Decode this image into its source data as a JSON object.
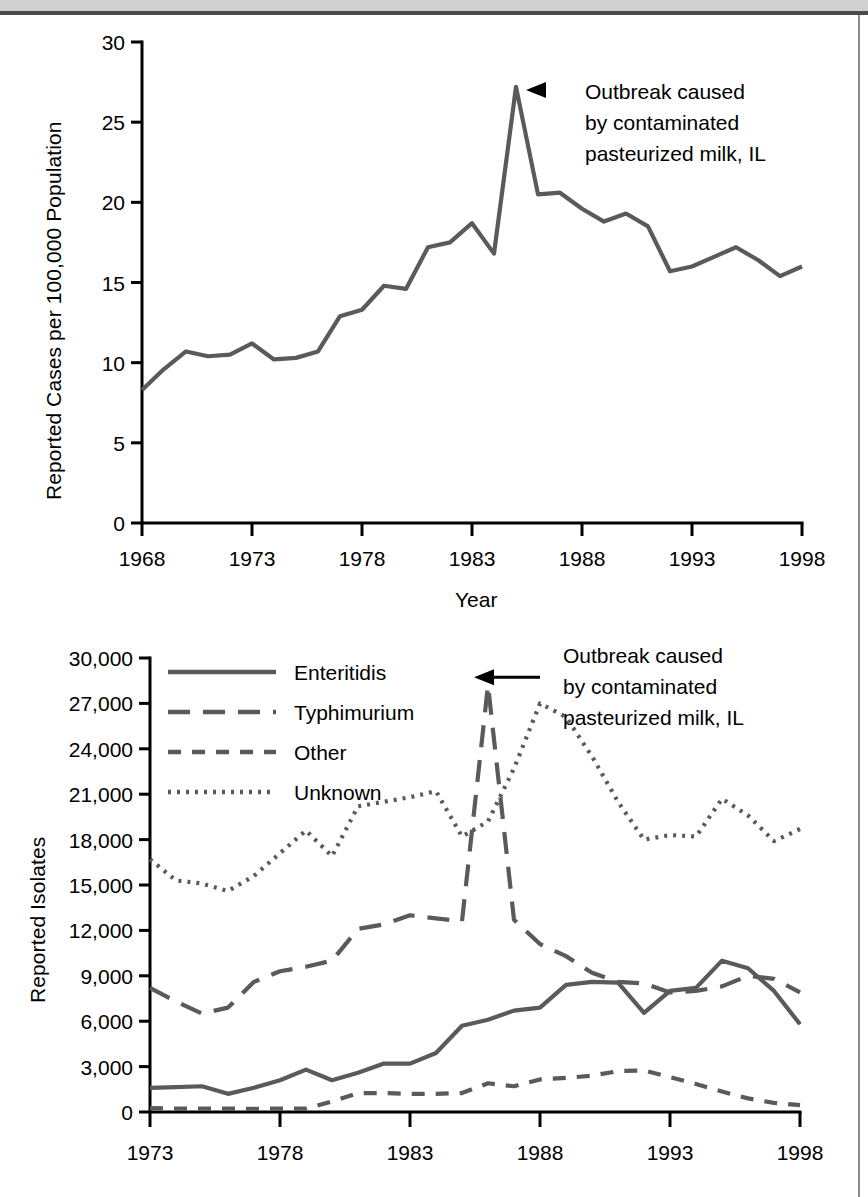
{
  "page": {
    "header_band_color": "#d0d0d0",
    "series_color": "#5a5a5a",
    "axis_color": "#000000"
  },
  "chart_data": [
    {
      "id": "salmonellosis-incidence",
      "type": "line",
      "title": "",
      "xlabel": "Year",
      "ylabel": "Reported Cases per 100,000 Population",
      "xlim": [
        1968,
        1998
      ],
      "ylim": [
        0,
        30
      ],
      "ytick_labels": [
        "0",
        "5",
        "10",
        "15",
        "20",
        "25",
        "30"
      ],
      "ytick_values": [
        0,
        5,
        10,
        15,
        20,
        25,
        30
      ],
      "xtick_labels": [
        "1968",
        "1973",
        "1978",
        "1983",
        "1988",
        "1993",
        "1998"
      ],
      "xtick_values": [
        1968,
        1973,
        1978,
        1983,
        1988,
        1993,
        1998
      ],
      "grid": false,
      "legend": "none",
      "annotations": [
        {
          "name": "outbreak-annotation",
          "lines": [
            "Outbreak caused",
            "by contaminated",
            "pasteurized milk, IL"
          ],
          "points_to_year": 1985,
          "points_to_value": 27.2
        }
      ],
      "series": [
        {
          "name": "Reported cases per 100,000",
          "style": "solid",
          "x": [
            1968,
            1969,
            1970,
            1971,
            1972,
            1973,
            1974,
            1975,
            1976,
            1977,
            1978,
            1979,
            1980,
            1981,
            1982,
            1983,
            1984,
            1985,
            1986,
            1987,
            1988,
            1989,
            1990,
            1991,
            1992,
            1993,
            1994,
            1995,
            1996,
            1997,
            1998
          ],
          "values": [
            8.3,
            9.6,
            10.7,
            10.4,
            10.5,
            11.2,
            10.2,
            10.3,
            10.7,
            12.9,
            13.3,
            14.8,
            14.6,
            17.2,
            17.5,
            18.7,
            16.8,
            27.2,
            20.5,
            20.6,
            19.6,
            18.8,
            19.3,
            18.5,
            15.7,
            16.0,
            16.6,
            17.2,
            16.4,
            15.4,
            16.0
          ]
        }
      ]
    },
    {
      "id": "salmonella-isolates-by-serotype",
      "type": "line",
      "title": "",
      "xlabel": "",
      "ylabel": "Reported Isolates",
      "xlim": [
        1973,
        1998
      ],
      "ylim": [
        0,
        30000
      ],
      "ytick_labels": [
        "0",
        "3,000",
        "6,000",
        "9,000",
        "12,000",
        "15,000",
        "18,000",
        "21,000",
        "24,000",
        "27,000",
        "30,000"
      ],
      "ytick_values": [
        0,
        3000,
        6000,
        9000,
        12000,
        15000,
        18000,
        21000,
        24000,
        27000,
        30000
      ],
      "xtick_labels": [
        "1973",
        "1978",
        "1983",
        "1988",
        "1993",
        "1998"
      ],
      "xtick_values": [
        1973,
        1978,
        1983,
        1988,
        1993,
        1998
      ],
      "grid": false,
      "legend": "upper-left",
      "annotations": [
        {
          "name": "outbreak-annotation",
          "lines": [
            "Outbreak caused",
            "by contaminated",
            "pasteurized milk, IL"
          ],
          "points_to_year": 1985,
          "points_to_value": 28200
        }
      ],
      "x": [
        1973,
        1974,
        1975,
        1976,
        1977,
        1978,
        1979,
        1980,
        1981,
        1982,
        1983,
        1984,
        1985,
        1986,
        1987,
        1988,
        1989,
        1990,
        1991,
        1992,
        1993,
        1994,
        1995,
        1996,
        1997,
        1998
      ],
      "series": [
        {
          "name": "Enteritidis",
          "style": "solid",
          "values": [
            1600,
            1650,
            1700,
            1200,
            1600,
            2100,
            2800,
            2100,
            2600,
            3200,
            3200,
            3900,
            5700,
            6100,
            6700,
            6900,
            8400,
            8600,
            8550,
            6550,
            8000,
            8200,
            10000,
            9500,
            8000,
            5800
          ]
        },
        {
          "name": "Typhimurium",
          "style": "long-dash",
          "values": [
            8200,
            7300,
            6500,
            6900,
            8600,
            9300,
            9600,
            10000,
            12100,
            12400,
            13000,
            12800,
            12600,
            28200,
            12700,
            11100,
            10300,
            9200,
            8600,
            8500,
            7900,
            8000,
            8300,
            9000,
            8800,
            7900
          ]
        },
        {
          "name": "Other",
          "style": "dash",
          "values": [
            260,
            220,
            220,
            230,
            200,
            230,
            220,
            700,
            1250,
            1250,
            1200,
            1200,
            1250,
            1900,
            1700,
            2150,
            2250,
            2400,
            2700,
            2750,
            2300,
            1850,
            1350,
            900,
            600,
            450
          ]
        },
        {
          "name": "Unknown",
          "style": "dotted",
          "values": [
            16700,
            15300,
            15100,
            14600,
            15600,
            17100,
            18600,
            16900,
            20200,
            20500,
            20800,
            21200,
            18200,
            19200,
            22700,
            27000,
            26100,
            23500,
            20500,
            18000,
            18300,
            18200,
            20700,
            19600,
            17900,
            18700
          ]
        }
      ]
    }
  ]
}
